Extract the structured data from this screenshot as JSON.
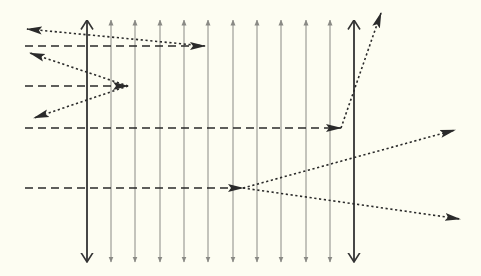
{
  "diagram": {
    "type": "ray-diagram",
    "background": "#fdfdf2",
    "colors": {
      "thick_line": "#333333",
      "thin_line": "#8a8a85",
      "ray": "#2a2a2a"
    },
    "thick_lines": [
      {
        "x": 87,
        "y1": 20,
        "y2": 262,
        "arrows": "both"
      },
      {
        "x": 354,
        "y1": 20,
        "y2": 262,
        "arrows": "both"
      }
    ],
    "thin_lines": [
      {
        "x": 111
      },
      {
        "x": 135
      },
      {
        "x": 160
      },
      {
        "x": 184
      },
      {
        "x": 208
      },
      {
        "x": 233
      },
      {
        "x": 257
      },
      {
        "x": 281
      },
      {
        "x": 306
      },
      {
        "x": 330
      }
    ],
    "incident_rays": [
      {
        "style": "dashed",
        "x1": 25,
        "y1": 46,
        "x2": 205,
        "y2": 46
      },
      {
        "style": "dashed",
        "x1": 25,
        "y1": 86,
        "x2": 128,
        "y2": 86
      },
      {
        "style": "dashed",
        "x1": 25,
        "y1": 128,
        "x2": 341,
        "y2": 128
      },
      {
        "style": "dashed",
        "x1": 25,
        "y1": 188,
        "x2": 243,
        "y2": 188
      }
    ],
    "outgoing_rays": [
      {
        "style": "dotted",
        "x1": 205,
        "y1": 46,
        "x2": 27,
        "y2": 29
      },
      {
        "style": "dotted",
        "x1": 128,
        "y1": 86,
        "x2": 30,
        "y2": 53
      },
      {
        "style": "dotted",
        "x1": 128,
        "y1": 86,
        "x2": 34,
        "y2": 118
      },
      {
        "style": "dotted",
        "x1": 341,
        "y1": 128,
        "x2": 381,
        "y2": 13
      },
      {
        "style": "dotted",
        "x1": 243,
        "y1": 188,
        "x2": 455,
        "y2": 130
      },
      {
        "style": "dotted",
        "x1": 243,
        "y1": 188,
        "x2": 460,
        "y2": 219
      }
    ]
  }
}
